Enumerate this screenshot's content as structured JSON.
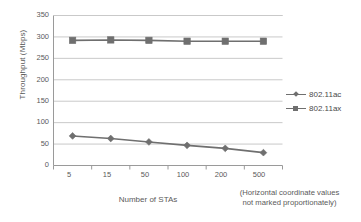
{
  "chart_data": {
    "type": "line",
    "title": "",
    "xlabel": "Number of STAs",
    "ylabel": "Throughput (Mbps)",
    "categories": [
      "5",
      "15",
      "50",
      "100",
      "200",
      "500"
    ],
    "ylim": [
      0,
      350
    ],
    "y_ticks": [
      "0",
      "50",
      "100",
      "150",
      "200",
      "250",
      "300",
      "350"
    ],
    "grid": true,
    "legend_position": "right",
    "note": "(Horizontal coordinate values not marked proportionately)",
    "note_line1": "(Horizontal coordinate values",
    "note_line2": "not marked proportionately)",
    "series": [
      {
        "name": "802.11ac",
        "marker": "diamond",
        "color": "#6f6f6f",
        "values": [
          69,
          63,
          55,
          47,
          40,
          30
        ]
      },
      {
        "name": "802.11ax",
        "marker": "square",
        "color": "#6f6f6f",
        "values": [
          292,
          293,
          292,
          290,
          290,
          290
        ]
      }
    ]
  },
  "legend": {
    "items": [
      {
        "label": "802.11ac",
        "marker": "diamond"
      },
      {
        "label": "802.11ax",
        "marker": "square"
      }
    ]
  },
  "colors": {
    "line": "#6f6f6f",
    "grid": "#c9c9c9",
    "axis": "#9a9a9a",
    "text": "#4a4a4a"
  }
}
